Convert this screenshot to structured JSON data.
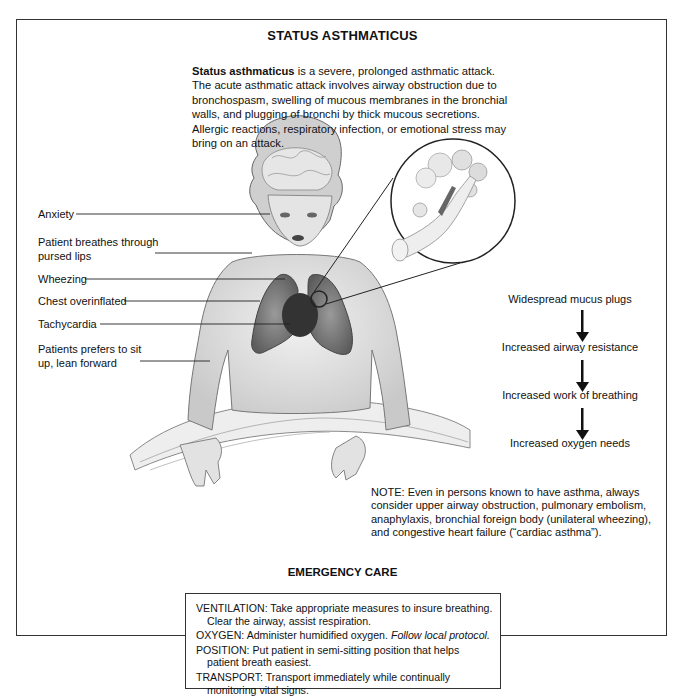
{
  "title": "STATUS ASTHMATICUS",
  "intro": {
    "bold_term": "Status asthmaticus",
    "text": " is a severe, prolonged asthmatic attack. The acute asthmatic attack involves airway obstruction due to bronchospasm, swelling of mucous membranes in the bronchial walls, and plugging of bronchi by thick mucous secretions. Allergic reactions, respiratory infection, or emotional stress may bring on an attack."
  },
  "illustration": {
    "subject": "child-sitting-up-with-lungs-and-brain-visible",
    "magnified_inset": "bronchiole-and-alveoli-with-mucus-plug"
  },
  "symptom_labels": [
    {
      "line1": "Anxiety",
      "line2": ""
    },
    {
      "line1": "Patient breathes through",
      "line2": "pursed lips"
    },
    {
      "line1": "Wheezing",
      "line2": ""
    },
    {
      "line1": "Chest overinflated",
      "line2": ""
    },
    {
      "line1": "Tachycardia",
      "line2": ""
    },
    {
      "line1": "Patients prefers to sit",
      "line2": "up, lean forward"
    }
  ],
  "flow": {
    "steps": [
      "Widespread mucus plugs",
      "Increased airway resistance",
      "Increased work of breathing",
      "Increased oxygen needs"
    ],
    "arrow_color": "#111111"
  },
  "note": "NOTE: Even in persons known to have asthma, always consider upper airway obstruction, pulmonary embolism, anaphylaxis, bronchial foreign body (unilateral wheezing), and congestive heart failure (“cardiac asthma”).",
  "emergency_care": {
    "title": "EMERGENCY CARE",
    "items": [
      {
        "head": "VENTILATION: Take appropriate measures to insure breathing.",
        "cont": "Clear the airway, assist respiration.",
        "italic": ""
      },
      {
        "head": "OXYGEN: Administer humidified oxygen. ",
        "cont": "",
        "italic": "Follow local protocol."
      },
      {
        "head": "POSITION: Put patient in semi-sitting position that helps",
        "cont": "patient breath easiest.",
        "italic": ""
      },
      {
        "head": "TRANSPORT: Transport immediately while continually",
        "cont": "monitoring vital signs.",
        "italic": ""
      }
    ]
  }
}
